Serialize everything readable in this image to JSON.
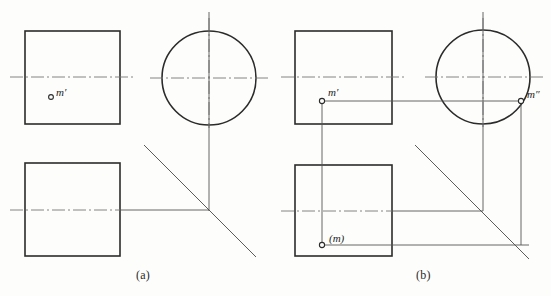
{
  "figure": {
    "background_color": "#fdfdfb",
    "line_color": "#2b2b2b",
    "thin_line_color": "#555555",
    "center_line_color": "#777777"
  },
  "captions": {
    "a": "(a)",
    "b": "(b)"
  },
  "panel_a": {
    "name": "Panel (a) — given views, point m' only",
    "labels": {
      "m_prime": "m′"
    },
    "front_view_square": {
      "x": 25,
      "y": 31,
      "width": 95,
      "height": 93
    },
    "top_view_square": {
      "x": 25,
      "y": 163,
      "width": 95,
      "height": 93
    },
    "side_view_circle": {
      "cx": 209,
      "cy": 78,
      "r": 47
    },
    "point_m_prime": {
      "x": 51,
      "y": 97
    },
    "miter_line": {
      "x1": 144,
      "y1": 145,
      "x2": 256,
      "y2": 257
    },
    "vertical_axis": {
      "x": 209,
      "y1": 12,
      "y2": 211
    },
    "horizontal_axis": {
      "x1": 120,
      "y1": 210,
      "x2": 209,
      "y2": 210
    }
  },
  "panel_b": {
    "name": "Panel (b) — solution, projections m', m\" and (m)",
    "labels": {
      "m_prime": "m′",
      "m_double_prime": "m″",
      "m_paren": "(m)"
    },
    "front_view_square": {
      "x": 295,
      "y": 31,
      "width": 97,
      "height": 93
    },
    "top_view_square": {
      "x": 295,
      "y": 165,
      "width": 97,
      "height": 91
    },
    "side_view_circle": {
      "cx": 483,
      "cy": 77,
      "r": 47
    },
    "point_m_prime": {
      "x": 322,
      "y": 101
    },
    "point_m_double_prime": {
      "x": 521,
      "y": 101
    },
    "point_m_paren": {
      "x": 322,
      "y": 245
    },
    "miter_line": {
      "x1": 415,
      "y1": 145,
      "x2": 529,
      "y2": 259
    },
    "vertical_axis": {
      "x": 483,
      "y1": 12,
      "y2": 211
    },
    "projection_lines": [
      {
        "from": [
          322,
          101
        ],
        "to": [
          521,
          101
        ],
        "type": "horizontal-m-prime-to-m-dprime"
      },
      {
        "from": [
          322,
          101
        ],
        "to": [
          322,
          245
        ],
        "type": "vertical-m-prime-to-m"
      },
      {
        "from": [
          322,
          245
        ],
        "to": [
          529,
          245
        ],
        "type": "horizontal-m-to-miter"
      },
      {
        "from": [
          521,
          101
        ],
        "to": [
          521,
          245
        ],
        "type": "vertical-m-dprime-down"
      }
    ]
  },
  "center_lines": {
    "style": "dash-dot",
    "panel_a_front_y": 77,
    "panel_a_top_y": 210,
    "panel_a_side_y": 78,
    "panel_b_front_y": 77,
    "panel_b_top_y": 211,
    "panel_b_side_y": 77
  }
}
